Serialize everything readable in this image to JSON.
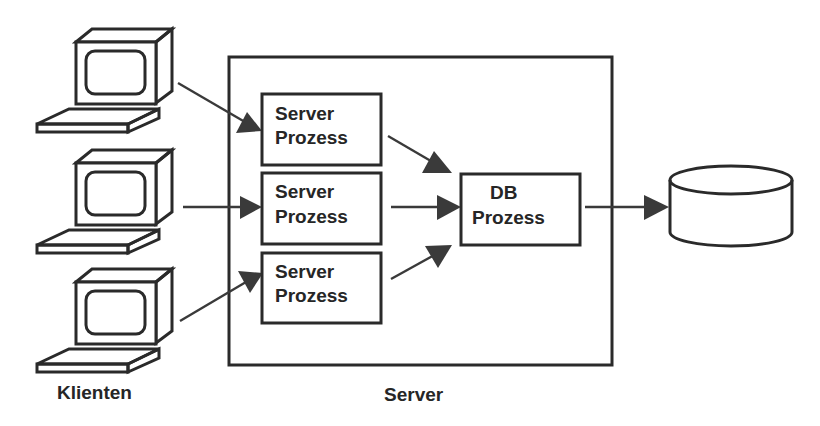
{
  "diagram": {
    "type": "client-server-architecture",
    "clients": {
      "label": "Klienten",
      "count": 3,
      "icon": "desktop-computer-icon"
    },
    "server": {
      "label": "Server",
      "processes": [
        {
          "line1": "Server",
          "line2": "Prozess"
        },
        {
          "line1": "Server",
          "line2": "Prozess"
        },
        {
          "line1": "Server",
          "line2": "Prozess"
        }
      ],
      "db_process": {
        "line1": "DB",
        "line2": "Prozess"
      }
    },
    "database": {
      "icon": "database-cylinder-icon"
    },
    "edges": [
      {
        "from": "client-1",
        "to": "server-process-1"
      },
      {
        "from": "client-2",
        "to": "server-process-2"
      },
      {
        "from": "client-3",
        "to": "server-process-3"
      },
      {
        "from": "server-process-1",
        "to": "db-process"
      },
      {
        "from": "server-process-2",
        "to": "db-process"
      },
      {
        "from": "server-process-3",
        "to": "db-process"
      },
      {
        "from": "db-process",
        "to": "database"
      }
    ],
    "colors": {
      "stroke": "#2a2a2a",
      "arrow": "#3a3a3a",
      "text": "#262626",
      "background": "#ffffff"
    }
  }
}
